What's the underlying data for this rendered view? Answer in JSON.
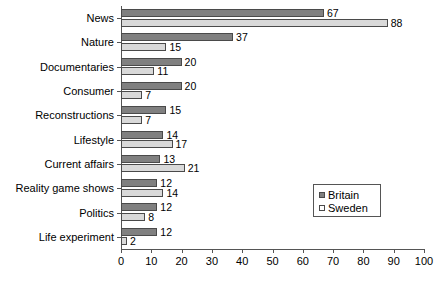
{
  "chart_data": {
    "type": "bar",
    "orientation": "horizontal",
    "title": "",
    "xlabel": "",
    "ylabel": "",
    "xlim": [
      0,
      100
    ],
    "xticks": [
      0,
      10,
      20,
      30,
      40,
      50,
      60,
      70,
      80,
      90,
      100
    ],
    "grid": false,
    "legend_position": "center-right",
    "categories": [
      "News",
      "Nature",
      "Documentaries",
      "Consumer",
      "Reconstructions",
      "Lifestyle",
      "Current affairs",
      "Reality game shows",
      "Politics",
      "Life experiment"
    ],
    "series": [
      {
        "name": "Britain",
        "color": "#808080",
        "values": [
          67,
          37,
          20,
          20,
          15,
          14,
          13,
          12,
          12,
          12
        ]
      },
      {
        "name": "Sweden",
        "color": "#d9d9d9",
        "values": [
          88,
          15,
          11,
          7,
          7,
          17,
          21,
          14,
          8,
          2
        ]
      }
    ]
  },
  "legend": {
    "entries": [
      {
        "label": "Britain"
      },
      {
        "label": "Sweden"
      }
    ]
  },
  "caption": {
    "text": ""
  }
}
